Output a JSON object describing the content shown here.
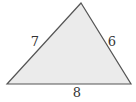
{
  "diagram": {
    "type": "triangle",
    "fill_color": "#ebebeb",
    "stroke_color": "#555555",
    "vertices": {
      "apex": {
        "x": 81,
        "y": 3
      },
      "bottom_left": {
        "x": 7,
        "y": 84
      },
      "bottom_right": {
        "x": 131,
        "y": 84
      }
    },
    "sides": {
      "left": {
        "label": "7",
        "x": 35,
        "y": 46
      },
      "right": {
        "label": "6",
        "x": 112,
        "y": 46
      },
      "bottom": {
        "label": "8",
        "x": 77,
        "y": 97
      }
    }
  }
}
